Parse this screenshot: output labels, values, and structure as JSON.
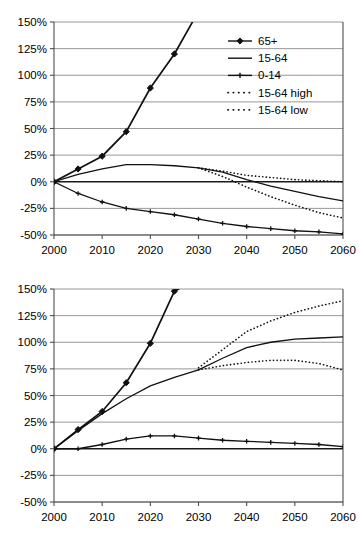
{
  "figure": {
    "background": "#ffffff",
    "panel_count": 2
  },
  "axis": {
    "x_ticks": [
      "2000",
      "2010",
      "2020",
      "2030",
      "2040",
      "2050",
      "2060"
    ],
    "y_ticks": [
      "150%",
      "125%",
      "100%",
      "75%",
      "50%",
      "25%",
      "0%",
      "-25%",
      "-50%"
    ],
    "xlim": [
      2000,
      2060
    ],
    "ylim": [
      -50,
      150
    ],
    "grid": true,
    "zero_line": true,
    "tick_color": "#4d4d4d",
    "grid_color": "#8c8c8c"
  },
  "legend": {
    "position": "upper-right-panel-1",
    "entries": [
      {
        "label": "65+",
        "style": "solid-marker",
        "marker": "diamond-large"
      },
      {
        "label": "15-64",
        "style": "solid",
        "marker": "none"
      },
      {
        "label": "0-14",
        "style": "solid-marker",
        "marker": "plus-small"
      },
      {
        "label": "15-64 high",
        "style": "dotted",
        "marker": "none"
      },
      {
        "label": "15-64 low",
        "style": "dotted",
        "marker": "none"
      }
    ]
  },
  "chart_data": [
    {
      "type": "line",
      "panel": "top",
      "title": "",
      "xlabel": "",
      "ylabel": "",
      "xlim": [
        2000,
        2060
      ],
      "ylim": [
        -50,
        150
      ],
      "x": [
        2000,
        2005,
        2010,
        2015,
        2020,
        2025,
        2030,
        2035,
        2040,
        2045,
        2050,
        2055,
        2060
      ],
      "series": [
        {
          "name": "65+",
          "style": "solid-marker",
          "marker": "diamond-large",
          "clipped_above_axis": true,
          "values": [
            0,
            12,
            24,
            47,
            88,
            120,
            160,
            null,
            null,
            null,
            null,
            null,
            null
          ]
        },
        {
          "name": "15-64",
          "style": "solid",
          "marker": "none",
          "values": [
            0,
            7,
            12,
            16,
            16,
            15,
            13,
            9,
            2,
            -4,
            -9,
            -14,
            -18
          ]
        },
        {
          "name": "0-14",
          "style": "solid-marker",
          "marker": "plus-small",
          "values": [
            0,
            -11,
            -19,
            -25,
            -28,
            -31,
            -35,
            -39,
            -42,
            -44,
            -46,
            -47,
            -49
          ]
        },
        {
          "name": "15-64 high",
          "style": "dotted",
          "marker": "none",
          "values": [
            null,
            null,
            null,
            null,
            null,
            null,
            13,
            10,
            6,
            4,
            2,
            1,
            0
          ]
        },
        {
          "name": "15-64 low",
          "style": "dotted",
          "marker": "none",
          "values": [
            null,
            null,
            null,
            null,
            null,
            null,
            13,
            5,
            -5,
            -14,
            -22,
            -29,
            -34
          ]
        }
      ]
    },
    {
      "type": "line",
      "panel": "bottom",
      "title": "",
      "xlabel": "",
      "ylabel": "",
      "xlim": [
        2000,
        2060
      ],
      "ylim": [
        -50,
        150
      ],
      "x": [
        2000,
        2005,
        2010,
        2015,
        2020,
        2025,
        2030,
        2035,
        2040,
        2045,
        2050,
        2055,
        2060
      ],
      "series": [
        {
          "name": "65+",
          "style": "solid-marker",
          "marker": "diamond-large",
          "clipped_above_axis": true,
          "values": [
            0,
            18,
            35,
            62,
            99,
            148,
            160,
            null,
            null,
            null,
            null,
            null,
            null
          ]
        },
        {
          "name": "15-64",
          "style": "solid",
          "marker": "none",
          "values": [
            0,
            17,
            33,
            47,
            59,
            67,
            74,
            85,
            95,
            100,
            103,
            104,
            105
          ]
        },
        {
          "name": "0-14",
          "style": "solid-marker",
          "marker": "plus-small",
          "values": [
            0,
            0,
            4,
            9,
            12,
            12,
            10,
            8,
            7,
            6,
            5,
            4,
            2
          ]
        },
        {
          "name": "15-64 high",
          "style": "dotted",
          "marker": "none",
          "values": [
            null,
            null,
            null,
            null,
            null,
            null,
            76,
            93,
            110,
            120,
            128,
            134,
            139
          ]
        },
        {
          "name": "15-64 low",
          "style": "dotted",
          "marker": "none",
          "values": [
            null,
            null,
            null,
            null,
            null,
            null,
            74,
            78,
            81,
            83,
            83,
            80,
            74
          ]
        }
      ]
    }
  ]
}
